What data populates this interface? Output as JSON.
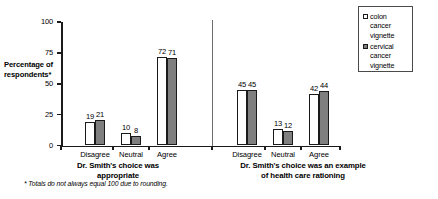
{
  "chart_data": {
    "type": "bar",
    "title": "",
    "xlabel": "",
    "ylabel": "Percentage of respondents*",
    "ylim": [
      0,
      100
    ],
    "yticks": [
      "0",
      "25",
      "50",
      "75",
      "100"
    ],
    "grid": false,
    "legend_position": "right",
    "categories": [
      "Disagree",
      "Neutral",
      "Agree"
    ],
    "groups": [
      {
        "caption_line1": "Dr. Smith's choice was",
        "caption_line2": "appropriate",
        "series": [
          {
            "name": "colon cancer vignette",
            "values": [
              19,
              10,
              72
            ]
          },
          {
            "name": "cervical cancer vignette",
            "values": [
              21,
              8,
              71
            ]
          }
        ]
      },
      {
        "caption_line1": "Dr. Smith's choice was an example",
        "caption_line2": "of health care rationing",
        "series": [
          {
            "name": "colon cancer vignette",
            "values": [
              45,
              13,
              42
            ]
          },
          {
            "name": "cervical cancer vignette",
            "values": [
              45,
              12,
              44
            ]
          }
        ]
      }
    ],
    "series_colors": [
      "#ffffff",
      "#7f7f7f"
    ],
    "annotations": [
      "* Totals do not  always equal 100 due to rounding."
    ]
  },
  "legend": {
    "entries": [
      {
        "swatch": "light",
        "line1": "colon",
        "line2": "cancer",
        "line3": "vignette"
      },
      {
        "swatch": "dark",
        "line1": "cervical",
        "line2": "cancer",
        "line3": "vignette"
      }
    ]
  },
  "footnote": "* Totals do not  always equal 100 due to rounding.",
  "axis": {
    "y_label_line1": "Percentage of",
    "y_label_line2": "respondents*"
  }
}
